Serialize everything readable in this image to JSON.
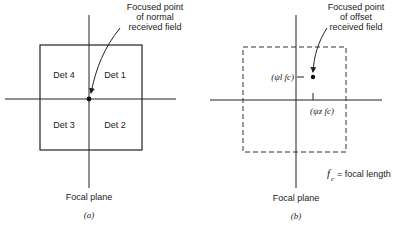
{
  "figure_a": {
    "annotation": [
      "Focused point",
      "of normal",
      "received field"
    ],
    "detectors": {
      "top_left": "Det 4",
      "top_right": "Det 1",
      "bottom_left": "Det 3",
      "bottom_right": "Det 2"
    },
    "axis_label": "Focal plane",
    "caption": "(a)"
  },
  "figure_b": {
    "annotation": [
      "Focused point",
      "of offset",
      "received field"
    ],
    "y_offset_label": "(ψl fc)",
    "x_offset_label": "(ψz fc)",
    "legend": "fc = focal length",
    "legend_symbol": "f",
    "legend_subscript": "c",
    "legend_text": "= focal length",
    "axis_label": "Focal plane",
    "caption": "(b)"
  },
  "colors": {
    "line": "#222222",
    "background": "#ffffff"
  }
}
